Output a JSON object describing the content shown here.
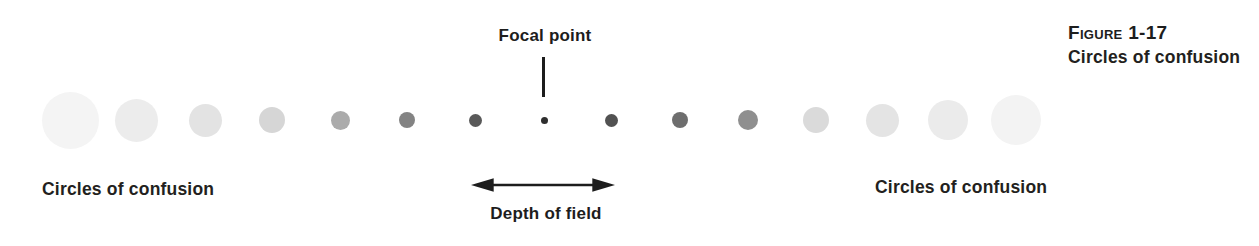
{
  "figure_caption": {
    "line1": "Figure 1-17",
    "line2": "Circles of confusion"
  },
  "labels": {
    "focal_point": "Focal point",
    "depth_of_field": "Depth of field",
    "circles_of_confusion_left": "Circles of confusion",
    "circles_of_confusion_right": "Circles of confusion"
  },
  "colors": {
    "background": "#ffffff",
    "text": "#231f20",
    "line": "#1d1d1d",
    "focal_dot": "#2e2e2e"
  },
  "diagram": {
    "baseline_y": 120,
    "circles": [
      {
        "x": 70,
        "d": 57,
        "color": "#f4f4f4"
      },
      {
        "x": 136,
        "d": 43,
        "color": "#ececec"
      },
      {
        "x": 205,
        "d": 33,
        "color": "#e3e3e3"
      },
      {
        "x": 272,
        "d": 26,
        "color": "#d6d6d6"
      },
      {
        "x": 340,
        "d": 19,
        "color": "#ababab"
      },
      {
        "x": 407,
        "d": 16,
        "color": "#838383"
      },
      {
        "x": 475,
        "d": 13,
        "color": "#595959"
      },
      {
        "x": 544,
        "d": 7,
        "color": "#2e2e2e",
        "role": "focal-point"
      },
      {
        "x": 611,
        "d": 13,
        "color": "#525252"
      },
      {
        "x": 680,
        "d": 16,
        "color": "#6e6e6e"
      },
      {
        "x": 748,
        "d": 20,
        "color": "#8f8f8f"
      },
      {
        "x": 816,
        "d": 26,
        "color": "#dadada"
      },
      {
        "x": 882,
        "d": 33,
        "color": "#e4e4e4"
      },
      {
        "x": 948,
        "d": 40,
        "color": "#ebebeb"
      },
      {
        "x": 1016,
        "d": 50,
        "color": "#f3f3f3"
      }
    ],
    "pointer_line": {
      "x": 543,
      "y1": 57,
      "y2": 97
    },
    "dof_arrow": {
      "x1": 471,
      "x2": 615,
      "y": 185
    }
  }
}
